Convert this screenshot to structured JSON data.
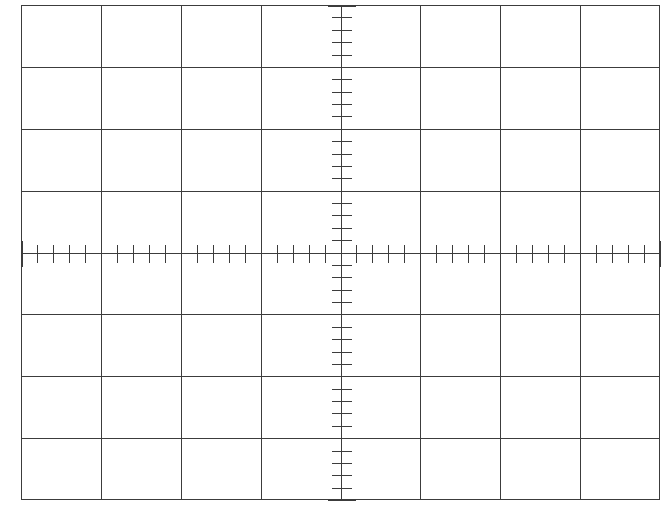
{
  "graticule": {
    "title": "Oscilloscope Graticule",
    "description": "Blank oscilloscope CRT graticule: 8 by 8 major divisions with minor tick marks along the centre horizontal and vertical axes.",
    "frame": {
      "x": 21,
      "y": 5,
      "width": 639,
      "height": 495
    },
    "divisions_horizontal": 8,
    "divisions_vertical": 8,
    "minor_ticks_per_division": 5,
    "colors": {
      "background": "#ffffff",
      "grid_line": "#3c3c3c",
      "border": "#3c3c3c",
      "axis": "#3c3c3c",
      "tick": "#3c3c3c"
    },
    "line_widths": {
      "grid_line": 1.1,
      "border": 1.4,
      "axis": 1.2,
      "tick_minor": 1.5,
      "tick_major": 1.6
    },
    "tick_lengths": {
      "horizontal_axis_minor_half": 9,
      "horizontal_axis_major_half": 13,
      "vertical_axis_minor_half": 10,
      "vertical_axis_major_half": 14
    },
    "center": {
      "x": 340.5,
      "y": 252.5
    }
  },
  "chart_data": {
    "type": "scatter",
    "subtitle": "",
    "xlabel": "",
    "ylabel": "",
    "x": [],
    "values": [],
    "series": [],
    "xlim": [
      -4,
      4
    ],
    "ylim": [
      -4,
      4
    ],
    "xticks": [
      -4,
      -3,
      -2,
      -1,
      0,
      1,
      2,
      3,
      4
    ],
    "yticks": [
      -4,
      -3,
      -2,
      -1,
      0,
      1,
      2,
      3,
      4
    ],
    "xtick_labels": [
      "",
      "",
      "",
      "",
      "",
      "",
      "",
      "",
      ""
    ],
    "ytick_labels": [
      "",
      "",
      "",
      "",
      "",
      "",
      "",
      "",
      ""
    ],
    "minor_tick_interval": 0.2,
    "grid": true,
    "legend": false,
    "legend_position": "none",
    "annotations": []
  }
}
